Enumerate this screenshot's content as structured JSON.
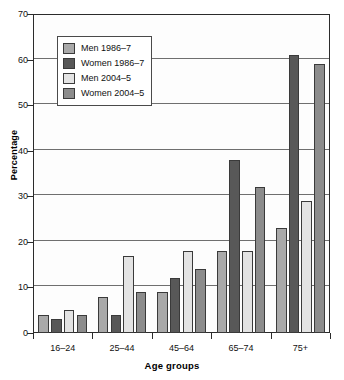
{
  "chart_data": {
    "type": "bar",
    "title": "",
    "xlabel": "Age groups",
    "ylabel": "Percentage",
    "categories": [
      "16–24",
      "25–44",
      "45–64",
      "65–74",
      "75+"
    ],
    "ylim": [
      0,
      70
    ],
    "yticks": [
      0,
      10,
      20,
      30,
      40,
      50,
      60,
      70
    ],
    "ytick_labels": [
      "0",
      "10",
      "20",
      "30",
      "40",
      "50",
      "60",
      "70"
    ],
    "grid": true,
    "legend_position": "upper left inside",
    "series": [
      {
        "name": "Men 1986–7",
        "color": "#a9a9a9",
        "values": [
          4,
          8,
          9,
          18,
          23
        ]
      },
      {
        "name": "Women 1986–7",
        "color": "#585858",
        "values": [
          3,
          4,
          12,
          38,
          61
        ]
      },
      {
        "name": "Men 2004–5",
        "color": "#e3e3e3",
        "values": [
          5,
          17,
          18,
          18,
          29
        ]
      },
      {
        "name": "Women 2004–5",
        "color": "#8c8c8c",
        "values": [
          4,
          9,
          14,
          32,
          59
        ]
      }
    ]
  },
  "axes": {
    "y_title": "Percentage",
    "x_title": "Age groups"
  },
  "colors": {
    "men_1986": "#a9a9a9",
    "women_1986": "#585858",
    "men_2004": "#e3e3e3",
    "women_2004": "#8c8c8c",
    "axis": "#2b2b2b",
    "grid": "#6f6f6f",
    "plot_bg": "#fdfdfd"
  }
}
